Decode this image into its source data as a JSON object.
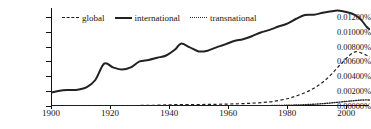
{
  "chart_data": {
    "type": "line",
    "title": "",
    "xlabel": "",
    "ylabel": "",
    "xlim": [
      1900,
      2008
    ],
    "ylim": [
      0.0,
      0.0132
    ],
    "grid": false,
    "legend_position": "top-left",
    "x_tick_labels": [
      "1900",
      "1920",
      "1940",
      "1960",
      "1980",
      "2000"
    ],
    "x_ticks": [
      1900,
      1920,
      1940,
      1960,
      1980,
      2000
    ],
    "y_tick_labels": [
      "0.00000%",
      "0.00200%",
      "0.00400%",
      "0.00600%",
      "0.00800%",
      "0.01000%",
      "0.01200%"
    ],
    "y_ticks": [
      0.0,
      0.002,
      0.004,
      0.006,
      0.008,
      0.01,
      0.012
    ],
    "series": [
      {
        "name": "global",
        "style": "dashed",
        "color": "#222222",
        "x": [
          1900,
          1905,
          1910,
          1915,
          1920,
          1925,
          1930,
          1935,
          1940,
          1945,
          1950,
          1955,
          1960,
          1965,
          1970,
          1975,
          1980,
          1983,
          1986,
          1989,
          1992,
          1995,
          1998,
          2001,
          2003,
          2005,
          2007,
          2008
        ],
        "values": [
          2e-05,
          2e-05,
          2e-05,
          3e-05,
          4e-05,
          5e-05,
          7e-05,
          0.0001,
          0.00016,
          0.00019,
          0.0002,
          0.00022,
          0.00026,
          0.00032,
          0.00042,
          0.0006,
          0.00098,
          0.00135,
          0.0018,
          0.0024,
          0.0032,
          0.0043,
          0.0056,
          0.0068,
          0.0073,
          0.00715,
          0.0068,
          0.0066
        ]
      },
      {
        "name": "international",
        "style": "solid",
        "color": "#222222",
        "x": [
          1900,
          1903,
          1906,
          1909,
          1912,
          1915,
          1918,
          1921,
          1924,
          1927,
          1930,
          1933,
          1936,
          1939,
          1942,
          1944,
          1947,
          1950,
          1953,
          1956,
          1959,
          1962,
          1965,
          1968,
          1971,
          1974,
          1977,
          1980,
          1983,
          1986,
          1989,
          1992,
          1995,
          1997,
          2000,
          2003,
          2005,
          2007,
          2008
        ],
        "values": [
          0.0018,
          0.00205,
          0.00215,
          0.0022,
          0.0025,
          0.0035,
          0.0057,
          0.0052,
          0.0049,
          0.0052,
          0.006,
          0.0062,
          0.0065,
          0.0068,
          0.0076,
          0.0084,
          0.0079,
          0.00735,
          0.00745,
          0.0079,
          0.0083,
          0.00875,
          0.009,
          0.0094,
          0.0099,
          0.01025,
          0.0107,
          0.0111,
          0.01175,
          0.01225,
          0.0123,
          0.01255,
          0.01275,
          0.01285,
          0.01265,
          0.01225,
          0.0116,
          0.0106,
          0.0103
        ]
      },
      {
        "name": "transnational",
        "style": "dotted",
        "color": "#222222",
        "x": [
          1900,
          1910,
          1920,
          1930,
          1940,
          1950,
          1960,
          1965,
          1970,
          1975,
          1980,
          1985,
          1990,
          1995,
          2000,
          2003,
          2005,
          2007,
          2008
        ],
        "values": [
          0.0,
          0.0,
          1e-05,
          1e-05,
          2e-05,
          2e-05,
          3e-05,
          3e-05,
          4e-05,
          6e-05,
          0.0001,
          0.00016,
          0.00026,
          0.00042,
          0.00062,
          0.00074,
          0.0008,
          0.00082,
          0.0008
        ]
      }
    ]
  },
  "legend": {
    "items": [
      {
        "label": "global",
        "swatch": "dashed-line-swatch"
      },
      {
        "label": "international",
        "swatch": "solid-line-swatch"
      },
      {
        "label": "transnational",
        "swatch": "dotted-line-swatch"
      }
    ]
  }
}
